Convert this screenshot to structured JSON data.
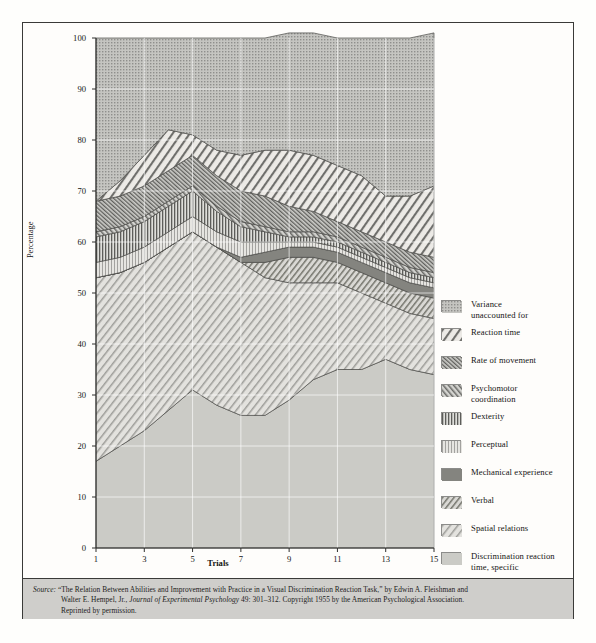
{
  "figure": {
    "axis_title_y": "Percentage",
    "axis_title_x": "Trials"
  },
  "source": {
    "label": "Source:",
    "line1_a": "“The Relation Between Abilities and Improvement with Practice in a Visual Discrimination Reaction Task,” by Edwin A. Fleishman and",
    "line2_a": "Walter E. Hempel, Jr., ",
    "line2_ital": "Journal of Experimental Psychology",
    "line2_b": " 49: 301–312.  Copyright 1955 by the American Psychological Association.",
    "line3": "Reprinted by permission."
  },
  "legend": {
    "items": [
      {
        "label": "Variance\nunaccounted for",
        "pattern": "dots-coarse",
        "color": "#a9a9a6"
      },
      {
        "label": "Reaction time",
        "pattern": "diag-wide-right",
        "color": "#e8e7e3"
      },
      {
        "label": "Rate of movement",
        "pattern": "diag-dense-left",
        "color": "#9e9e9b"
      },
      {
        "label": "Psychomotor\ncoordination",
        "pattern": "diag-med-left",
        "color": "#a8a8a5"
      },
      {
        "label": "Dexterity",
        "pattern": "vert-dense",
        "color": "#b3b3b0"
      },
      {
        "label": "Perceptual",
        "pattern": "vert-light",
        "color": "#cfcfcc"
      },
      {
        "label": "Mechanical experience",
        "pattern": "solid-dark",
        "color": "#8a8a87"
      },
      {
        "label": "Verbal",
        "pattern": "diag-med-right",
        "color": "#bdbdba"
      },
      {
        "label": "Spatial relations",
        "pattern": "diag-wide-right2",
        "color": "#e4e3df"
      },
      {
        "label": "Discrimination reaction\ntime, specific",
        "pattern": "solid-light",
        "color": "#c9c9c5"
      }
    ]
  },
  "chart_data": {
    "type": "area",
    "title": "",
    "xlabel": "Trials",
    "ylabel": "Percentage",
    "xlim": [
      1,
      15
    ],
    "ylim": [
      0,
      100
    ],
    "ytick_values": [
      0,
      10,
      20,
      30,
      40,
      50,
      60,
      70,
      80,
      90,
      100
    ],
    "xtick_values": [
      1,
      3,
      5,
      7,
      9,
      11,
      13,
      15
    ],
    "grid": true,
    "stacked": true,
    "x": [
      1,
      2,
      3,
      4,
      5,
      6,
      7,
      8,
      9,
      10,
      11,
      12,
      13,
      14,
      15
    ],
    "series": [
      {
        "name": "Discrimination reaction time, specific",
        "order": 1,
        "values": [
          17,
          20,
          23,
          27,
          31,
          28,
          26,
          26,
          29,
          33,
          35,
          35,
          37,
          35,
          34
        ]
      },
      {
        "name": "Spatial relations",
        "order": 2,
        "values": [
          36,
          34,
          33,
          32,
          31,
          31,
          30,
          27,
          23,
          19,
          17,
          15,
          11,
          11,
          11
        ]
      },
      {
        "name": "Verbal",
        "order": 3,
        "values": [
          0,
          0,
          0,
          0,
          0,
          0,
          0,
          3,
          5,
          5,
          4,
          4,
          4,
          4,
          4
        ]
      },
      {
        "name": "Mechanical experience",
        "order": 4,
        "values": [
          0,
          0,
          0,
          0,
          0,
          0,
          1,
          2,
          2,
          2,
          2,
          2,
          2,
          2,
          2
        ]
      },
      {
        "name": "Perceptual",
        "order": 5,
        "values": [
          3,
          3,
          3,
          3,
          3,
          3,
          3,
          2,
          1,
          1,
          1,
          1,
          1,
          1,
          1
        ]
      },
      {
        "name": "Dexterity",
        "order": 6,
        "values": [
          5,
          5,
          5,
          5,
          5,
          4,
          3,
          2,
          1,
          1,
          1,
          1,
          1,
          1,
          1
        ]
      },
      {
        "name": "Psychomotor coordination",
        "order": 7,
        "values": [
          1,
          1,
          1,
          1,
          1,
          1,
          1,
          1,
          1,
          1,
          1,
          1,
          1,
          1,
          1
        ]
      },
      {
        "name": "Rate of movement",
        "order": 8,
        "values": [
          6,
          6,
          6,
          6,
          6,
          6,
          6,
          6,
          5,
          4,
          3,
          3,
          3,
          3,
          3
        ]
      },
      {
        "name": "Reaction time",
        "order": 9,
        "values": [
          0,
          3,
          6,
          8,
          4,
          5,
          7,
          9,
          11,
          11,
          11,
          11,
          9,
          11,
          14
        ]
      },
      {
        "name": "Variance unaccounted for",
        "order": 10,
        "values": [
          32,
          28,
          23,
          18,
          19,
          22,
          23,
          22,
          23,
          24,
          25,
          27,
          31,
          31,
          30
        ]
      }
    ]
  }
}
